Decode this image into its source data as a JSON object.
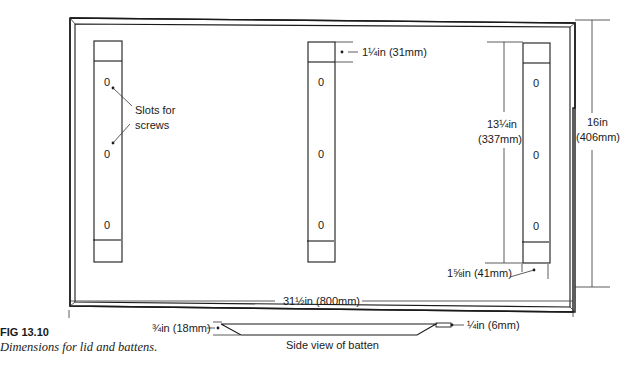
{
  "figure": {
    "number": "FIG 13.10",
    "caption": "Dimensions for lid and battens."
  },
  "labels": {
    "slots": "Slots for",
    "slots2": "screws",
    "end_block": "1¼in (31mm)",
    "batten_span_line1": "13¼in",
    "batten_span_line2": "(337mm)",
    "height_line1": "16in",
    "height_line2": "(406mm)",
    "bottom_gap": "1⅝in (41mm)",
    "width": "31½in (800mm)",
    "batten_thick": "¾in (18mm)",
    "batten_thin": "¼in (6mm)",
    "side_view": "Side view of batten"
  },
  "slot_mark": "0",
  "battens": [
    {
      "name": "left",
      "x": 94
    },
    {
      "name": "middle",
      "x": 308
    },
    {
      "name": "right",
      "x": 523
    }
  ]
}
